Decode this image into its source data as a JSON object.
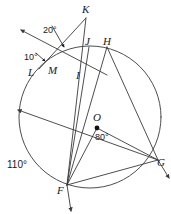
{
  "figure": {
    "type": "circle-geometry-diagram",
    "stroke_color": "#3a3a3a",
    "text_color": "#1a1a1a",
    "background_color": "#ffffff",
    "circle": {
      "cx": 90,
      "cy": 117,
      "r": 71
    },
    "center_point_label": "O",
    "points": [
      {
        "name": "K",
        "label": "K",
        "x": 86,
        "y": 18,
        "label_x": 82,
        "label_y": 4,
        "on_circle": false,
        "dot": false
      },
      {
        "name": "J",
        "label": "J",
        "x": 89,
        "y": 47,
        "label_x": 85,
        "label_y": 36,
        "on_circle": true,
        "dot": false
      },
      {
        "name": "H",
        "label": "H",
        "x": 107,
        "y": 47,
        "label_x": 103,
        "label_y": 36,
        "on_circle": true,
        "dot": false
      },
      {
        "name": "I",
        "label": "I",
        "x": 79,
        "y": 69,
        "label_x": 76,
        "label_y": 71,
        "on_circle": false,
        "dot": false
      },
      {
        "name": "M",
        "label": "M",
        "x": 49,
        "y": 64,
        "label_x": 48,
        "label_y": 66,
        "on_circle": false,
        "dot": false
      },
      {
        "name": "L",
        "label": "L",
        "x": 39,
        "y": 69,
        "label_x": 28,
        "label_y": 67,
        "on_circle": true,
        "dot": false
      },
      {
        "name": "O",
        "label": "O",
        "x": 97,
        "y": 128,
        "label_x": 93,
        "label_y": 113,
        "on_circle": false,
        "dot": true
      },
      {
        "name": "G",
        "label": "G",
        "x": 158,
        "y": 160,
        "label_x": 158,
        "label_y": 158,
        "on_circle": true,
        "dot": false
      },
      {
        "name": "F",
        "label": "F",
        "x": 67,
        "y": 185,
        "label_x": 57,
        "label_y": 186,
        "on_circle": true,
        "dot": false
      }
    ],
    "angle_labels": [
      {
        "name": "angle-20",
        "text": "20°",
        "x": 43,
        "y": 26
      },
      {
        "name": "angle-10",
        "text": "10°",
        "x": 24,
        "y": 53
      },
      {
        "name": "angle-80",
        "text": "80°",
        "x": 95,
        "y": 134
      },
      {
        "name": "arc-110",
        "text": "110°",
        "x": 7,
        "y": 160
      }
    ],
    "segments": [
      {
        "name": "segment-K-F",
        "from": "K",
        "to": "F"
      },
      {
        "name": "segment-K-I-extended",
        "from": "K",
        "to": "F"
      },
      {
        "name": "segment-J-F",
        "from": "J",
        "to": "F"
      },
      {
        "name": "segment-H-F",
        "from": "H",
        "to": "F"
      },
      {
        "name": "segment-H-G",
        "from": "H",
        "to": "G"
      },
      {
        "name": "segment-F-G",
        "from": "F",
        "to": "G"
      },
      {
        "name": "segment-L-G-secant",
        "from": "L",
        "to": "G"
      },
      {
        "name": "segment-O-G",
        "from": "O",
        "to": "G"
      }
    ],
    "rays": [
      {
        "name": "ray-upper-left",
        "direction": "up-left",
        "arrowhead": true
      },
      {
        "name": "ray-lower-left",
        "direction": "down-left",
        "arrowhead": true
      },
      {
        "name": "ray-below-F",
        "direction": "down",
        "arrowhead": true
      },
      {
        "name": "ray-beyond-G",
        "direction": "down-right",
        "arrowhead": true
      },
      {
        "name": "pointer-20",
        "direction": "down-right",
        "arrowhead": true
      },
      {
        "name": "pointer-10",
        "direction": "down-right",
        "arrowhead": true
      }
    ]
  }
}
